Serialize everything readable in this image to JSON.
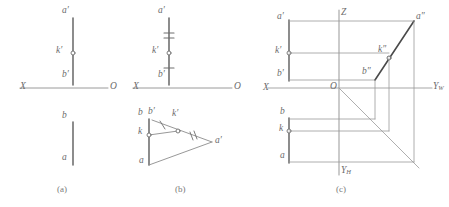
{
  "figure": {
    "title_captions": [
      {
        "id": "cap-a",
        "text": "(a)",
        "x": 57,
        "y": 186
      },
      {
        "id": "cap-b",
        "text": "(b)",
        "x": 175,
        "y": 186
      },
      {
        "id": "cap-c",
        "text": "(c)",
        "x": 336,
        "y": 186
      }
    ],
    "colors": {
      "line": "#8c8c8c",
      "line_dark": "#4a4a4a",
      "axis": "#9a9a9a",
      "text": "#6b6b6b",
      "caption": "#7a7a7a",
      "background": "#ffffff",
      "point_fill": "#ffffff"
    },
    "panel_a": {
      "name": "two-view projection of line AB with point K",
      "axis": {
        "left_label": "X",
        "right_label": "O",
        "y": 88,
        "x_start": 20,
        "x_end": 108
      },
      "labels": [
        {
          "id": "a-prime",
          "text": "a",
          "prime": "′",
          "x": 62,
          "y": 9
        },
        {
          "id": "k-prime",
          "text": "k",
          "prime": "′",
          "x": 56,
          "y": 50
        },
        {
          "id": "b-prime",
          "text": "b",
          "prime": "′",
          "x": 62,
          "y": 72
        },
        {
          "id": "b-top",
          "text": "b",
          "prime": "",
          "x": 62,
          "y": 115
        },
        {
          "id": "a-bottom",
          "text": "a",
          "prime": "",
          "x": 62,
          "y": 157
        }
      ],
      "front_view": {
        "x": 73,
        "y_top": 18,
        "y_bottom": 84
      },
      "top_view": {
        "x": 73,
        "y_top": 122,
        "y_bottom": 165
      },
      "point_k_prime": {
        "x": 73,
        "y": 53
      }
    },
    "panel_b": {
      "name": "true length construction by rotation",
      "axis": {
        "left_label": "X",
        "right_label": "O",
        "y": 88,
        "x_start": 133,
        "x_end": 232
      },
      "labels": [
        {
          "id": "a-prime",
          "text": "a",
          "prime": "′",
          "x": 158,
          "y": 9
        },
        {
          "id": "k-prime",
          "text": "k",
          "prime": "′",
          "x": 152,
          "y": 50
        },
        {
          "id": "b-prime",
          "text": "b",
          "prime": "′",
          "x": 158,
          "y": 72
        },
        {
          "id": "b-top",
          "text": "b",
          "prime": "",
          "x": 141,
          "y": 112
        },
        {
          "id": "b-prime-rot",
          "text": "b",
          "prime": "′",
          "x": 152,
          "y": 112
        },
        {
          "id": "k-prime-rot",
          "text": "k",
          "prime": "′",
          "x": 173,
          "y": 114
        },
        {
          "id": "k-plain",
          "text": "k",
          "prime": "",
          "x": 140,
          "y": 130
        },
        {
          "id": "a-bottom",
          "text": "a",
          "prime": "",
          "x": 141,
          "y": 158
        },
        {
          "id": "a-prime-rot",
          "text": "a",
          "prime": "′",
          "x": 214,
          "y": 139
        }
      ],
      "front_view": {
        "x": 169,
        "y_top": 18,
        "y_bottom": 84
      },
      "point_k_prime": {
        "x": 169,
        "y": 53
      },
      "tick_marks": {
        "upper_double": {
          "x": 169,
          "y1": 33,
          "y2": 38,
          "half_width": 5
        },
        "lower_single": {
          "x": 169,
          "y": 68,
          "half_width": 5
        }
      },
      "triangle": {
        "b_point": {
          "x": 149,
          "y": 120
        },
        "a_point": {
          "x": 149,
          "y": 164
        },
        "a_rot_point": {
          "x": 211,
          "y": 142
        },
        "k_point": {
          "x": 149,
          "y": 135
        },
        "k_rot_point": {
          "x": 178,
          "y": 131
        }
      }
    },
    "panel_c": {
      "name": "three-view orthographic projection",
      "axis_labels": {
        "x_axis": "X",
        "origin": "O",
        "z_axis": "Z",
        "y_w_axis": {
          "letter": "Y",
          "sub": "W"
        },
        "y_h_axis": {
          "letter": "Y",
          "sub": "H"
        }
      },
      "axes": {
        "origin": {
          "x": 339,
          "y": 88
        },
        "horizontal": {
          "x_start": 268,
          "x_end": 432
        },
        "vertical": {
          "y_start": 10,
          "y_end": 175
        },
        "bisector": {
          "x1": 339,
          "y1": 88,
          "x2": 418,
          "y2": 167
        }
      },
      "labels": [
        {
          "id": "a-prime",
          "text": "a",
          "prime": "′",
          "x": 278,
          "y": 15
        },
        {
          "id": "k-prime",
          "text": "k",
          "prime": "′",
          "x": 276,
          "y": 50
        },
        {
          "id": "b-prime",
          "text": "b",
          "prime": "′",
          "x": 278,
          "y": 72
        },
        {
          "id": "b-top",
          "text": "b",
          "prime": "",
          "x": 281,
          "y": 111
        },
        {
          "id": "k-plain",
          "text": "k",
          "prime": "",
          "x": 280,
          "y": 128
        },
        {
          "id": "a-bottom",
          "text": "a",
          "prime": "",
          "x": 281,
          "y": 155
        },
        {
          "id": "a-double-prime",
          "text": "a",
          "prime": "″",
          "x": 415,
          "y": 15
        },
        {
          "id": "k-double-prime",
          "text": "k",
          "prime": "″",
          "x": 379,
          "y": 49
        },
        {
          "id": "b-double-prime",
          "text": "b",
          "prime": "″",
          "x": 363,
          "y": 70
        }
      ],
      "front_view": {
        "x": 289,
        "y_top": 20,
        "y_bottom": 80
      },
      "top_view": {
        "x": 289,
        "y_top": 118,
        "y_bottom": 162
      },
      "side_view": {
        "a_x": 414,
        "a_y": 22,
        "b_x": 375,
        "b_y": 79,
        "k_x": 389,
        "k_y": 58
      },
      "points": [
        {
          "id": "k-prime-point",
          "x": 289,
          "y": 53
        },
        {
          "id": "k-point",
          "x": 289,
          "y": 131
        },
        {
          "id": "k-double-prime-point",
          "x": 389,
          "y": 58
        }
      ]
    }
  }
}
